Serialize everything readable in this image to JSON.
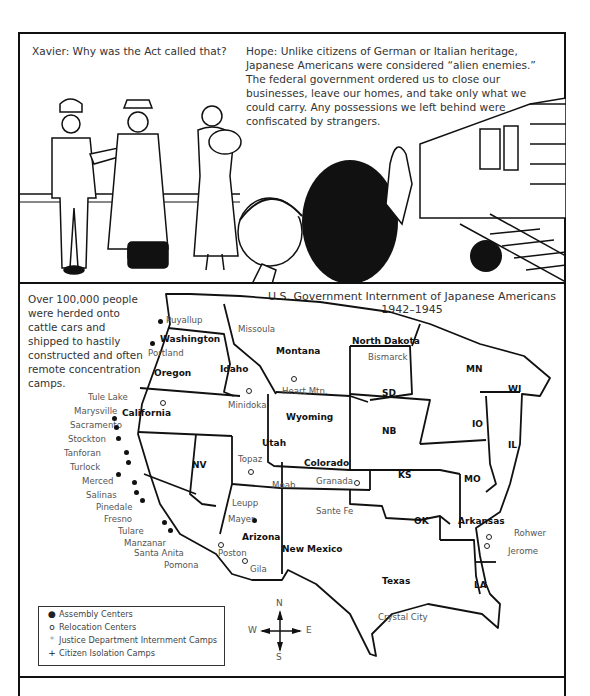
{
  "panel1": {
    "xavier_caption": "Xavier: Why was the Act called that?",
    "hope_caption": "Hope: Unlike citizens of German or Italian heritage, Japanese Americans were considered “alien enemies.” The federal government ordered us to close our businesses, leave our homes, and take only what we could carry. Any possessions we left behind were confiscated by strangers.",
    "illustration": "soldier-family-and-train-station-scene"
  },
  "panel2": {
    "note": "Over 100,000 people were herded onto cattle cars and shipped to hastily constructed and often remote concentration camps.",
    "title_line1": "U.S. Government Internment of Japanese Americans",
    "title_line2": "1942–1945",
    "states": [
      "Washington",
      "Oregon",
      "California",
      "Idaho",
      "Montana",
      "Wyoming",
      "NV",
      "Utah",
      "Arizona",
      "Colorado",
      "New Mexico",
      "North Dakota",
      "SD",
      "NB",
      "KS",
      "OK",
      "Texas",
      "MN",
      "IO",
      "MO",
      "Arkansas",
      "LA",
      "WI",
      "IL"
    ],
    "sites": {
      "assembly": [
        "Puyallup",
        "Portland",
        "Marysville",
        "Sacramento",
        "Stockton",
        "Tanforan",
        "Turlock",
        "Merced",
        "Salinas",
        "Pinedale",
        "Fresno",
        "Tulare",
        "Santa Anita",
        "Pomona",
        "Mayer"
      ],
      "relocation": [
        "Tule Lake",
        "Minidoka",
        "Heart Mtn.",
        "Topaz",
        "Granada",
        "Manzanar",
        "Poston",
        "Gila",
        "Rohwer",
        "Jerome"
      ],
      "justice": [
        "Missoula",
        "Bismarck",
        "Sante Fe",
        "Crystal City"
      ],
      "isolation": [
        "Moab",
        "Leupp"
      ]
    },
    "legend": [
      {
        "symbol": "●",
        "label": "Assembly Centers"
      },
      {
        "symbol": "o",
        "label": "Relocation Centers"
      },
      {
        "symbol": "*",
        "label": "Justice Department Internment Camps"
      },
      {
        "symbol": "+",
        "label": "Citizen Isolation Camps"
      }
    ],
    "compass": {
      "n": "N",
      "s": "S",
      "e": "E",
      "w": "W"
    }
  }
}
